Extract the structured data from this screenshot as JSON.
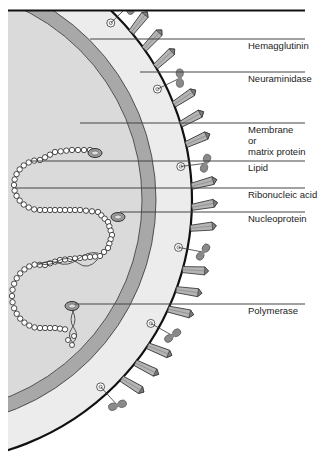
{
  "diagram": {
    "colors": {
      "background": "#ffffff",
      "envelope_fill": "#ececec",
      "matrix_band": "#a8a8a8",
      "core_fill": "#dadada",
      "spike": "#b4b4b4",
      "spike_dark": "#7c7c7c",
      "neuraminidase": "#8a8a8a",
      "line": "#333333"
    },
    "labels": [
      {
        "id": "hemagglutinin",
        "lines": [
          "Hemagglutinin"
        ],
        "line_y": 39
      },
      {
        "id": "neuraminidase",
        "lines": [
          "Neuraminidase"
        ],
        "line_y": 72
      },
      {
        "id": "membrane",
        "lines": [
          "Membrane",
          "or",
          "matrix protein"
        ],
        "line_y": 123
      },
      {
        "id": "lipid",
        "lines": [
          "Lipid"
        ],
        "line_y": 161
      },
      {
        "id": "ribonucleic-acid",
        "lines": [
          "Ribonucleic acid"
        ],
        "line_y": 188
      },
      {
        "id": "nucleoprotein",
        "lines": [
          "Nucleoprotein"
        ],
        "line_y": 212
      },
      {
        "id": "polymerase",
        "lines": [
          "Polymerase"
        ],
        "line_y": 304
      }
    ]
  }
}
